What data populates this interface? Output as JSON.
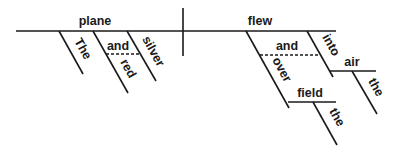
{
  "diagram": {
    "type": "sentence-diagram",
    "subject": "plane",
    "verb": "flew",
    "subject_modifiers": {
      "article": "The",
      "adjectives": [
        "red",
        "silver"
      ],
      "conjunction": "and"
    },
    "verb_modifiers": {
      "prepositions": [
        "over",
        "into"
      ],
      "conjunction": "and",
      "over_object": "field",
      "over_object_article": "the",
      "into_object": "air",
      "into_object_article": "the"
    }
  }
}
